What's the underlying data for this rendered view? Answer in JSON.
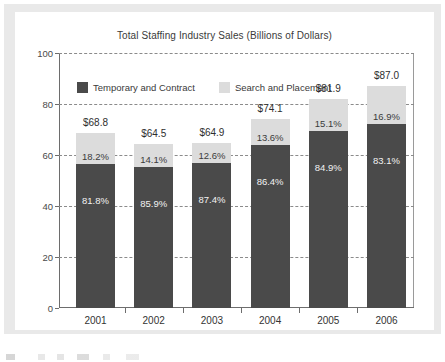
{
  "chart_data": {
    "type": "bar",
    "subtype": "stacked-bar-100-percent-with-totals",
    "title": "Total Staffing Industry Sales (Billions of Dollars)",
    "xlabel": "",
    "ylabel": "",
    "categories": [
      "2001",
      "2002",
      "2003",
      "2004",
      "2005",
      "2006"
    ],
    "ylim": [
      0,
      100
    ],
    "yticks": [
      "0",
      "20",
      "40",
      "60",
      "80",
      "100"
    ],
    "ytick_values": [
      0,
      20,
      40,
      60,
      80,
      100
    ],
    "grid": true,
    "grid_style": "dashed-horizontal",
    "legend_position": "top-left-inside",
    "series": [
      {
        "name": "Temporary and Contract",
        "color": "#4a4a4a",
        "values": [
          56.28,
          55.41,
          56.72,
          64.02,
          69.53,
          72.3
        ],
        "percent_labels": [
          "81.8%",
          "85.9%",
          "87.4%",
          "86.4%",
          "84.9%",
          "83.1%"
        ]
      },
      {
        "name": "Search and Placement",
        "color": "#dcdcdc",
        "values": [
          12.52,
          9.09,
          8.18,
          10.08,
          12.37,
          14.7
        ],
        "percent_labels": [
          "18.2%",
          "14.1%",
          "12.6%",
          "13.6%",
          "15.1%",
          "16.9%"
        ]
      }
    ],
    "totals": [
      68.8,
      64.5,
      64.9,
      74.1,
      81.9,
      87.0
    ],
    "total_labels": [
      "$68.8",
      "$64.5",
      "$64.9",
      "$74.1",
      "$81.9",
      "$87.0"
    ]
  },
  "legend": {
    "items": [
      {
        "label": "Temporary and Contract",
        "color": "#4a4a4a"
      },
      {
        "label": "Search and Placement",
        "color": "#dcdcdc"
      }
    ]
  },
  "colors": {
    "temporary_and_contract": "#4a4a4a",
    "search_and_placement": "#dcdcdc",
    "axis": "#6d6d6d",
    "gridline": "#8b8b8b",
    "panel_background": "#ffffff",
    "frame_background": "#e9e9e9",
    "title_text": "#3a3a3a"
  }
}
